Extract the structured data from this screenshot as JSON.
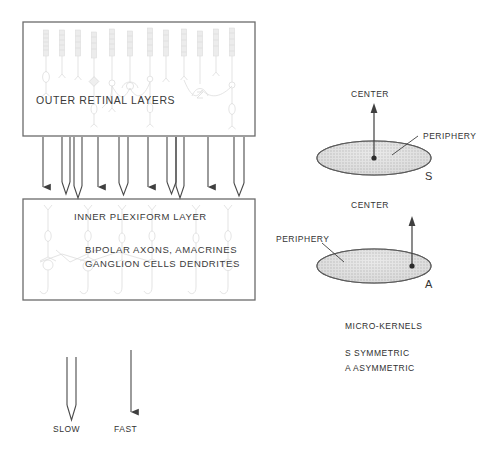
{
  "figure": {
    "title_implicit": "Retinal micro-kernel schematic",
    "boxes": [
      {
        "id": "outer-retinal-layers",
        "label": "OUTER RETINAL LAYERS",
        "x": 23,
        "y": 22,
        "w": 232,
        "h": 114
      },
      {
        "id": "inner-plexiform-layer",
        "label": "INNER PLEXIFORM LAYER",
        "sublabels": [
          "BIPOLAR AXONS, AMACRINES",
          "GANGLION CELLS DENDRITES"
        ],
        "x": 23,
        "y": 199,
        "w": 232,
        "h": 101
      }
    ],
    "connector_arrows": {
      "count": 10,
      "kinds": [
        "fast",
        "slow",
        "slow",
        "fast",
        "slow",
        "fast",
        "slow",
        "fast",
        "slow"
      ],
      "note": "alternating solid (fast) and hollow double-line (slow) arrows from outer retinal layers into inner plexiform layer"
    },
    "legend_arrows": [
      {
        "id": "slow-arrow",
        "label": "SLOW",
        "style": "hollow-double-line",
        "x": 72,
        "y": 357,
        "length": 62
      },
      {
        "id": "fast-arrow",
        "label": "FAST",
        "style": "solid-single-line",
        "x": 127,
        "y": 350,
        "length": 72
      }
    ],
    "kernels": [
      {
        "id": "kernel-s",
        "letter": "S",
        "center_label": "CENTER",
        "periphery_label": "PERIPHERY",
        "ellipse": {
          "cx": 374,
          "cy": 158,
          "rx": 57,
          "ry": 17
        },
        "center_dot": {
          "x": 374,
          "y": 158
        },
        "arrow_top_y": 104,
        "symmetry": "symmetric"
      },
      {
        "id": "kernel-a",
        "letter": "A",
        "center_label": "CENTER",
        "periphery_label": "PERIPHERY",
        "ellipse": {
          "cx": 374,
          "cy": 266,
          "rx": 57,
          "ry": 17
        },
        "center_dot": {
          "x": 412,
          "y": 266
        },
        "arrow_top_y": 216,
        "symmetry": "asymmetric"
      }
    ],
    "caption": {
      "heading": "MICRO-KERNELS",
      "lines": [
        "S SYMMETRIC",
        "A ASYMMETRIC"
      ]
    },
    "colors": {
      "stroke": "#4a4a4a",
      "text": "#2b2b2b",
      "ellipse_fill": "#d8d8d8",
      "box_border": "#6b6b6b",
      "faint_cell": "#bdbdbd"
    }
  }
}
